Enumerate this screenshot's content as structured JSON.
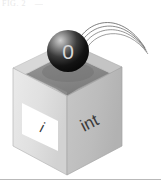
{
  "figure": {
    "title_fragment_top": "FIG. 2",
    "title_fragment_top2": "—",
    "caption_rule": ""
  },
  "diagram": {
    "type": "isometric-box-with-falling-ball",
    "box": {
      "name": "int-box",
      "right_face_label": "int",
      "left_face_label": "i",
      "left_face_label_box": "label-plate",
      "top_open": true,
      "colors": {
        "left_face": "#e2e2e2",
        "right_face": "#bdbdbd",
        "top_rim_left": "#d4d4d4",
        "top_rim_right": "#a8a8a8",
        "inner_cavity": "#8f8f8f",
        "inner_cavity_dark": "#7a7a7a",
        "outline": "#9a9a9a",
        "label_plate": "#ffffff"
      }
    },
    "ball": {
      "name": "value-ball",
      "label": "0",
      "colors": {
        "core": "#111111",
        "mid": "#4a4a4a",
        "highlight": "#c9c9c9",
        "text": "#d8d8d8"
      }
    },
    "trajectory": {
      "name": "motion-arcs",
      "arc_count": 4,
      "color": "#6a6a6a"
    }
  }
}
